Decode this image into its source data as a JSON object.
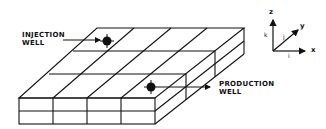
{
  "diagram": {
    "type": "reservoir-grid-block",
    "labels": {
      "injection_well": [
        "INJECTION",
        "WELL"
      ],
      "production_well": [
        "PRODUCTION",
        "WELL"
      ]
    },
    "axes": {
      "z": "z",
      "y": "y",
      "x": "x",
      "k": "k",
      "j": "j",
      "i": "i"
    },
    "grid": {
      "columns_front": 4,
      "layers": 2,
      "rows_depth": 3
    },
    "colors": {
      "line": "#111111",
      "background": "#ffffff"
    }
  }
}
